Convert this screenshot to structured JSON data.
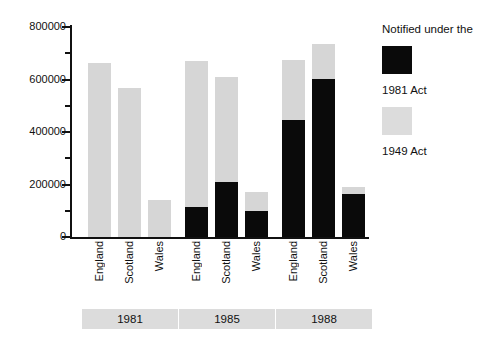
{
  "chart_data": {
    "type": "bar",
    "title": "",
    "subtitle": "",
    "xlabel": "",
    "ylabel": "",
    "stacked": true,
    "grid": false,
    "ylim": [
      0,
      800000
    ],
    "ytick_labels": [
      "0",
      "200000",
      "400000",
      "600000",
      "800000"
    ],
    "ytick_values": [
      0,
      200000,
      400000,
      600000,
      800000
    ],
    "yminor_tick_values": [
      100000,
      300000,
      500000,
      700000
    ],
    "categories": [
      "England",
      "Scotland",
      "Wales",
      "England",
      "Scotland",
      "Wales",
      "England",
      "Scotland",
      "Wales"
    ],
    "groups": [
      {
        "label": "1981",
        "categories": [
          "England",
          "Scotland",
          "Wales"
        ]
      },
      {
        "label": "1985",
        "categories": [
          "England",
          "Scotland",
          "Wales"
        ]
      },
      {
        "label": "1988",
        "categories": [
          "England",
          "Scotland",
          "Wales"
        ]
      }
    ],
    "series": [
      {
        "name": "1981 Act",
        "color": "#0a0a0a",
        "values": [
          0,
          0,
          0,
          114000,
          210000,
          99000,
          446000,
          602000,
          164000
        ]
      },
      {
        "name": "1949 Act",
        "color": "#dcdcdc",
        "values": [
          663000,
          568000,
          141000,
          556000,
          400000,
          72000,
          229000,
          133000,
          26000
        ]
      }
    ],
    "totals": [
      663000,
      568000,
      141000,
      670000,
      610000,
      171000,
      675000,
      735000,
      190000
    ],
    "legend": {
      "position": "right",
      "title": "Notified under the",
      "entries": [
        {
          "label": "1981 Act",
          "color": "#0a0a0a",
          "swatch": "black-swatch"
        },
        {
          "label": "1949 Act",
          "color": "#dcdcdc",
          "swatch": "gray-swatch"
        }
      ]
    }
  },
  "colors": {
    "series_1981_act": "#0a0a0a",
    "series_1949_act": "#dcdcdc",
    "group_box": "#dcdcdc",
    "axis": "#111111",
    "background": "#ffffff"
  }
}
